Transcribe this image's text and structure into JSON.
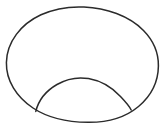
{
  "image": {
    "kind": "line-drawing",
    "description": "Hand-drawn outline of an oval with an inner dome arc in the lower half",
    "width": 167,
    "height": 130,
    "background_color": "#ffffff",
    "has_border": false,
    "has_text": false,
    "has_labels": false
  },
  "style": {
    "stroke_color": "#2b2b2b",
    "stroke_width": 1.5,
    "inner_stroke_width": 1.5,
    "fill": "none"
  },
  "shapes": [
    {
      "name": "outer-oval",
      "type": "ellipse",
      "center_x": 82,
      "center_y": 64.5,
      "radius_x": 76,
      "radius_y": 57.5,
      "bounds": {
        "left": 6,
        "top": 7,
        "right": 158,
        "bottom": 122
      }
    },
    {
      "name": "inner-dome-arc",
      "type": "arc",
      "start_x": 36,
      "start_y": 111,
      "apex_x": 85,
      "apex_y": 79,
      "end_x": 131,
      "end_y": 110,
      "chord_width": 95,
      "height": 32
    }
  ],
  "paths": {
    "outer_oval_d": "M 6.4 62.5 C 6.8 42.0 21.0 24.0 41.0 14.8 C 55.5 8.1 71.0 6.4 84.0 7.0 C 106.0 7.9 129.0 15.8 143.5 30.5 C 154.0 41.2 158.6 53.0 158.4 66.0 C 158.2 81.5 151.0 96.0 138.5 106.5 C 125.0 117.8 106.0 122.5 88.0 122.3 C 68.0 122.1 48.0 118.0 33.0 108.0 C 16.5 97.0 6.0 80.5 6.4 62.5 Z",
    "inner_arc_d": "M 35.8 111.4 C 38.5 100.5 46.5 90.5 57.0 84.5 C 66.5 79.0 78.0 76.8 88.5 78.6 C 101.0 80.8 112.5 88.0 120.5 96.5 C 126.0 102.3 129.6 106.5 131.2 110.0"
  }
}
